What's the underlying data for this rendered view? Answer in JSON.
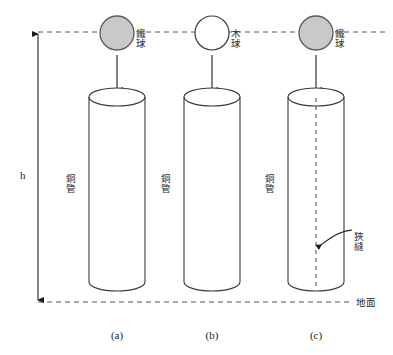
{
  "figure": {
    "title_note": "",
    "height_marker": {
      "label": "h",
      "top_y": 32,
      "bottom_y": 302
    },
    "reference_lines": {
      "release_line_label": "",
      "ground_line_label": "地面"
    },
    "columns": [
      {
        "id": "a",
        "caption": "(a)",
        "center_x": 117,
        "ball": {
          "name": "鐵球",
          "type": "iron",
          "filled": true,
          "fill_color": "#c9c9c9",
          "stroke_color": "#5a5a5a",
          "cx": 117,
          "cy": 33,
          "r": 17
        },
        "tube": {
          "name": "銅管",
          "left_x": 89,
          "right_x": 145,
          "top_y": 92,
          "bottom_y": 288,
          "has_slit": false
        }
      },
      {
        "id": "b",
        "caption": "(b)",
        "center_x": 212,
        "ball": {
          "name": "木球",
          "type": "wood",
          "filled": false,
          "fill_color": "#ffffff",
          "stroke_color": "#3a3a3a",
          "cx": 212,
          "cy": 33,
          "r": 17
        },
        "tube": {
          "name": "銅管",
          "left_x": 184,
          "right_x": 240,
          "top_y": 92,
          "bottom_y": 288,
          "has_slit": false
        }
      },
      {
        "id": "c",
        "caption": "(c)",
        "center_x": 316,
        "ball": {
          "name": "鐵球",
          "type": "iron",
          "filled": true,
          "fill_color": "#c9c9c9",
          "stroke_color": "#5a5a5a",
          "cx": 316,
          "cy": 33,
          "r": 17
        },
        "tube": {
          "name": "銅管",
          "left_x": 288,
          "right_x": 344,
          "top_y": 92,
          "bottom_y": 288,
          "has_slit": true
        }
      }
    ],
    "annotations": {
      "slit_label": "狹縫",
      "slit_label_x": 358,
      "slit_label_y": 238
    },
    "colors": {
      "stroke": "#3a3a3a",
      "dashed": "#555555",
      "iron_fill": "#c9c9c9",
      "background": "#ffffff"
    }
  }
}
